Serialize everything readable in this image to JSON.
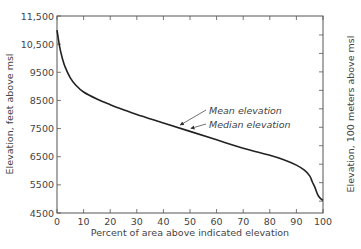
{
  "chart_data": {
    "type": "line",
    "title": "",
    "xlabel": "Percent of area above indicated elevation",
    "ylabel": "Elevation, feet above msl",
    "ylabel_right": "Elevation, 100 meters above msl",
    "xlim": [
      0,
      100
    ],
    "ylim": [
      4500,
      11500
    ],
    "ylim_right_note": "secondary axis in 100 m units",
    "x_ticks": [
      "0",
      "10",
      "20",
      "30",
      "40",
      "50",
      "60",
      "70",
      "80",
      "90",
      "100"
    ],
    "y_ticks": [
      "4500",
      "5500",
      "6500",
      "7500",
      "8500",
      "9500",
      "10,500",
      "11,500"
    ],
    "y_right_ticks": [
      "16",
      "20",
      "24",
      "28",
      "32"
    ],
    "grid": false,
    "series": [
      {
        "name": "Hypsometric curve",
        "x": [
          0,
          1,
          2,
          3,
          5,
          7,
          10,
          15,
          20,
          25,
          30,
          40,
          50,
          60,
          70,
          80,
          85,
          90,
          93,
          95,
          96,
          97,
          98,
          99,
          100
        ],
        "values": [
          11000,
          10400,
          10000,
          9700,
          9300,
          9050,
          8800,
          8550,
          8350,
          8170,
          8000,
          7700,
          7400,
          7100,
          6800,
          6550,
          6400,
          6200,
          6020,
          5820,
          5600,
          5400,
          5150,
          5020,
          4950
        ]
      }
    ],
    "annotations": [
      {
        "text": "Mean elevation",
        "x": 46,
        "y": 7520
      },
      {
        "text": "Median elevation",
        "x": 50,
        "y": 7400
      }
    ]
  },
  "labels": {
    "xlabel": "Percent of area above indicated elevation",
    "ylabel": "Elevation, feet above msl",
    "ylabel_right": "Elevation, 100 meters above msl",
    "mean": "Mean elevation",
    "median": "Median elevation"
  }
}
